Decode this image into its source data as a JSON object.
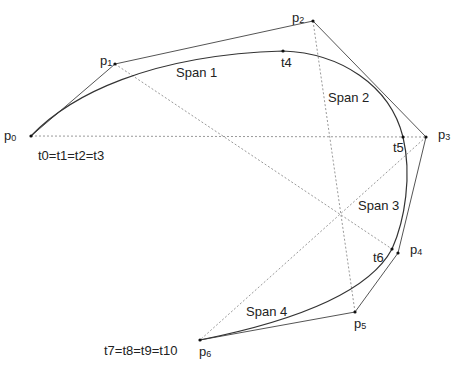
{
  "control_points": [
    {
      "name": "p",
      "sub": "0",
      "x": 31,
      "y": 136,
      "lx": 4,
      "ly": 140
    },
    {
      "name": "p",
      "sub": "1",
      "x": 115,
      "y": 64,
      "lx": 100,
      "ly": 65
    },
    {
      "name": "p",
      "sub": "2",
      "x": 313,
      "y": 21,
      "lx": 292,
      "ly": 22
    },
    {
      "name": "p",
      "sub": "3",
      "x": 426,
      "y": 137,
      "lx": 438,
      "ly": 139
    },
    {
      "name": "p",
      "sub": "4",
      "x": 398,
      "y": 253,
      "lx": 410,
      "ly": 254
    },
    {
      "name": "p",
      "sub": "5",
      "x": 355,
      "y": 312,
      "lx": 354,
      "ly": 328
    },
    {
      "name": "p",
      "sub": "6",
      "x": 200,
      "y": 340,
      "lx": 199,
      "ly": 356
    }
  ],
  "knots": [
    {
      "text": "t0=t1=t2=t3",
      "x": 38,
      "y": 160
    },
    {
      "text": "t4",
      "x": 281,
      "y": 67,
      "px": 283,
      "py": 51
    },
    {
      "text": "t5",
      "x": 393,
      "y": 152,
      "px": 403,
      "py": 137
    },
    {
      "text": "t6",
      "x": 373,
      "y": 262,
      "px": 392,
      "py": 249
    },
    {
      "text": "t7=t8=t9=t10",
      "x": 104,
      "y": 355
    }
  ],
  "spans": [
    {
      "label": "Span 1",
      "x": 176,
      "y": 78
    },
    {
      "label": "Span 2",
      "x": 328,
      "y": 103
    },
    {
      "label": "Span 3",
      "x": 358,
      "y": 211
    },
    {
      "label": "Span 4",
      "x": 246,
      "y": 317
    }
  ],
  "colors": {
    "line": "#444444",
    "dotted": "#999999",
    "text": "#222222"
  }
}
